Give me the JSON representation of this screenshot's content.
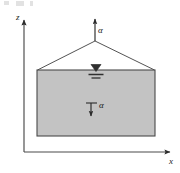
{
  "figure": {
    "kind": "engineering-diagram",
    "background_color": "#ffffff",
    "line_color": "#3a3a3a",
    "fill_color": "#c3c3c3",
    "axes": {
      "vertical_label": "z",
      "horizontal_label": "x",
      "origin": {
        "x": 24,
        "y": 152
      },
      "vertical_tip": {
        "x": 24,
        "y": 18
      },
      "horizontal_tip": {
        "x": 172,
        "y": 152
      }
    },
    "mass": {
      "left": 37,
      "right": 155,
      "top": 70,
      "bottom": 136,
      "fill_color": "#c3c3c3",
      "border_color": "#3a3a3a"
    },
    "apex": {
      "x": 95,
      "y": 41
    },
    "labels": {
      "acceleration_top": "α",
      "acceleration_inner": "α"
    },
    "water_table": {
      "symbol": "water-table-triangle",
      "center_x": 96,
      "top_y": 64
    }
  }
}
